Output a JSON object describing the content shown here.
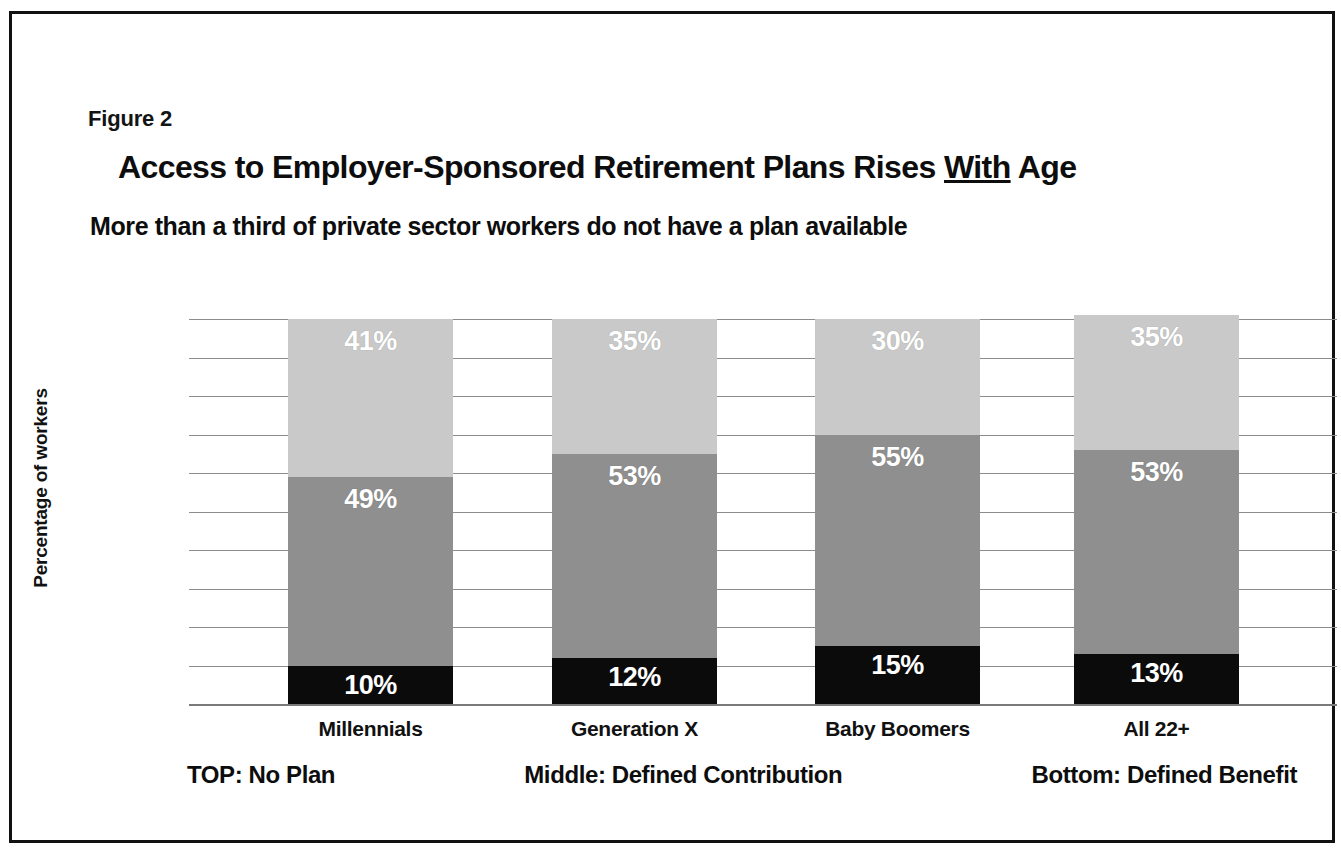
{
  "figure": {
    "number_label": "Figure 2",
    "title_pre": "Access to Employer-Sponsored Retirement Plans Rises ",
    "title_underlined": "With",
    "title_post": " Age",
    "subtitle": "More than a third of private sector workers do not have a plan available"
  },
  "legend": {
    "top": "TOP: No Plan",
    "middle": "Middle: Defined Contribution",
    "bottom": "Bottom: Defined Benefit"
  },
  "colors": {
    "no_plan": "#c9c9c9",
    "defined_contribution": "#8f8f8f",
    "defined_benefit": "#0b0b0b",
    "gridline": "#8c8c8c",
    "frame": "#111111",
    "text": "#0d0d0d"
  },
  "chart_data": {
    "type": "bar",
    "title": "Access to Employer-Sponsored Retirement Plans Rises With Age",
    "subtitle": "More than a third of private sector workers do not have a plan available",
    "xlabel": "",
    "ylabel": "Percentage of workers",
    "ylim": [
      0,
      100
    ],
    "yticks": [
      0,
      10,
      20,
      30,
      40,
      50,
      60,
      70,
      80,
      90,
      100
    ],
    "ytick_labels": [
      "0%",
      "10%",
      "20%",
      "30%",
      "40%",
      "50%",
      "60%",
      "70%",
      "80%",
      "90%",
      "100%"
    ],
    "grid": true,
    "stacked": true,
    "legend_position": "below-plot",
    "categories": [
      "Millennials",
      "Generation X",
      "Baby Boomers",
      "All 22+"
    ],
    "series": [
      {
        "name": "Defined Benefit",
        "stack_position": "bottom",
        "color": "#0b0b0b",
        "values": [
          10,
          12,
          15,
          13
        ],
        "labels": [
          "10%",
          "12%",
          "15%",
          "13%"
        ]
      },
      {
        "name": "Defined Contribution",
        "stack_position": "middle",
        "color": "#8f8f8f",
        "values": [
          49,
          53,
          55,
          53
        ],
        "labels": [
          "49%",
          "53%",
          "55%",
          "53%"
        ]
      },
      {
        "name": "No Plan",
        "stack_position": "top",
        "color": "#c9c9c9",
        "values": [
          41,
          35,
          30,
          35
        ],
        "labels": [
          "41%",
          "35%",
          "30%",
          "35%"
        ]
      }
    ]
  }
}
